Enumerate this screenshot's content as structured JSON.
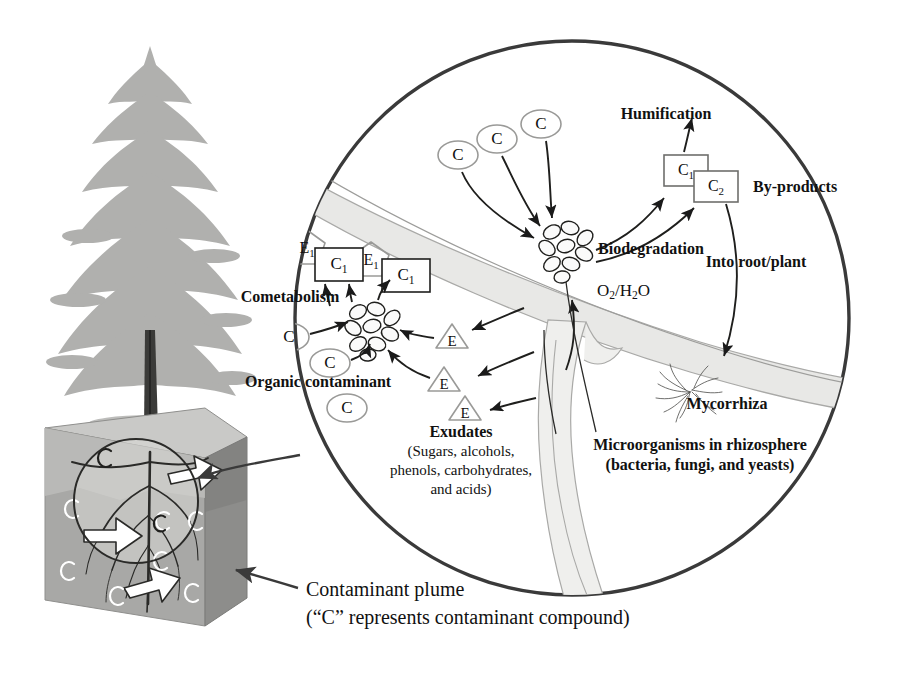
{
  "figure": {
    "type": "diagram",
    "caption_line1": "Contaminant plume",
    "caption_line2": "(“C” represents contaminant compound)"
  },
  "colors": {
    "ink": "#1a1a1a",
    "circle_border": "#3a3a3a",
    "gray_outline": "#9a9a9a",
    "root_fill": "#e8e8e6",
    "soil_top": "#c9c9c7",
    "soil_front": "#a8a8a6",
    "soil_side": "#8d8d8b",
    "tree_foliage": "#b0b0ae",
    "trunk": "#3b3b39",
    "white_arrow": "#ffffff"
  },
  "labels": {
    "humification": "Humification",
    "by_products": "By-products",
    "biodegradation": "Biodegradation",
    "into_root_plant": "Into root/plant",
    "cometabolism": "Cometabolism",
    "organic_contaminant": "Organic contaminant",
    "exudates": "Exudates",
    "exudates_detail_1": "(Sugars, alcohols,",
    "exudates_detail_2": "phenols, carbohydrates,",
    "exudates_detail_3": "and acids)",
    "mycorrhiza": "Mycorrhiza",
    "microorganisms_1": "Microorganisms in rhizosphere",
    "microorganisms_2": "(bacteria, fungi, and yeasts)"
  },
  "nodes": {
    "oxygen_water": "O₂/H₂O",
    "contaminant_symbol": "C",
    "enzyme_symbol": "E",
    "metabolite_1": "C₁",
    "metabolite_2": "C₂",
    "enzyme_1": "E₁"
  },
  "shapes": {
    "contaminant_ellipses_top": [
      {
        "id": "c-top-1",
        "label": "C",
        "cx": 458,
        "cy": 155
      },
      {
        "id": "c-top-2",
        "label": "C",
        "cx": 497,
        "cy": 139
      },
      {
        "id": "c-top-3",
        "label": "C",
        "cx": 541,
        "cy": 124
      }
    ],
    "contaminant_ellipses_left": [
      {
        "id": "c-left-1",
        "label": "C",
        "cx": 289,
        "cy": 337
      },
      {
        "id": "c-left-2",
        "label": "C",
        "cx": 330,
        "cy": 363
      },
      {
        "id": "c-left-3",
        "label": "C",
        "cx": 347,
        "cy": 408
      }
    ],
    "enzyme_triangles": [
      {
        "id": "e-tri-1",
        "label": "E",
        "cx": 452,
        "cy": 337
      },
      {
        "id": "e-tri-2",
        "label": "E",
        "cx": 444,
        "cy": 380
      },
      {
        "id": "e-tri-3",
        "label": "E",
        "cx": 465,
        "cy": 409
      }
    ],
    "enzyme_pentagons": [
      {
        "id": "e1-pent-1",
        "label": "E₁",
        "cx": 307,
        "cy": 245
      },
      {
        "id": "e1-pent-2",
        "label": "E₁",
        "cx": 371,
        "cy": 257
      }
    ],
    "metabolite_boxes": [
      {
        "id": "c1-box-left-1",
        "label": "C₁",
        "cx": 339,
        "cy": 264
      },
      {
        "id": "c1-box-left-2",
        "label": "C₁",
        "cx": 406,
        "cy": 275
      },
      {
        "id": "c1-box-right",
        "label": "C₁",
        "cx": 686,
        "cy": 171
      },
      {
        "id": "c2-box-right",
        "label": "C₂",
        "cx": 716,
        "cy": 186
      }
    ],
    "microbe_clusters": [
      {
        "id": "microbe-cluster-biodegradation",
        "cx": 567,
        "cy": 249
      },
      {
        "id": "microbe-cluster-cometabolism",
        "cx": 372,
        "cy": 329
      }
    ],
    "soil_contaminant_marks": [
      {
        "id": "soil-c-1",
        "cx": 72,
        "cy": 508
      },
      {
        "id": "soil-c-2",
        "cx": 68,
        "cy": 570
      },
      {
        "id": "soil-c-3",
        "cx": 117,
        "cy": 595
      },
      {
        "id": "soil-c-4",
        "cx": 161,
        "cy": 560
      },
      {
        "id": "soil-c-5",
        "cx": 192,
        "cy": 592
      },
      {
        "id": "soil-c-6",
        "cx": 196,
        "cy": 520
      },
      {
        "id": "soil-c-7",
        "cx": 105,
        "cy": 457
      },
      {
        "id": "soil-c-8",
        "cx": 163,
        "cy": 520
      }
    ]
  }
}
